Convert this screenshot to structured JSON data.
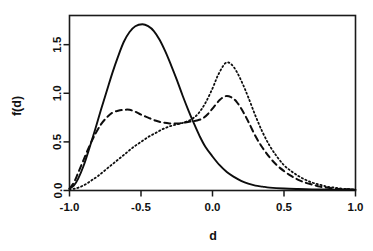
{
  "chart_data": {
    "type": "line",
    "title": "",
    "subtitle": "",
    "xlabel": "d",
    "ylabel": "f(d)",
    "xlim": [
      -1.0,
      1.0
    ],
    "ylim": [
      0.0,
      1.8
    ],
    "xticks": [
      -1.0,
      -0.5,
      0.0,
      0.5,
      1.0
    ],
    "xticklabels": [
      "-1.0",
      "-0.5",
      "0.0",
      "0.5",
      "1.0"
    ],
    "yticks": [
      0.0,
      0.5,
      1.0,
      1.5
    ],
    "yticklabels": [
      "0.0",
      "0.5",
      "1.0",
      "1.5"
    ],
    "grid": false,
    "legend": null,
    "legend_position": "none",
    "annotations": [],
    "series": [
      {
        "name": "solid",
        "linestyle": "solid",
        "color": "#0d0d0d",
        "x": [
          -1.0,
          -0.97,
          -0.94,
          -0.9,
          -0.86,
          -0.82,
          -0.78,
          -0.74,
          -0.7,
          -0.66,
          -0.62,
          -0.58,
          -0.54,
          -0.49,
          -0.45,
          -0.41,
          -0.37,
          -0.33,
          -0.29,
          -0.25,
          -0.21,
          -0.17,
          -0.13,
          -0.09,
          -0.05,
          0.0,
          0.05,
          0.1,
          0.15,
          0.2,
          0.25,
          0.3,
          0.35,
          0.4,
          0.5,
          0.6,
          0.7,
          0.8,
          0.9,
          1.0
        ],
        "y": [
          0.02,
          0.05,
          0.12,
          0.26,
          0.44,
          0.63,
          0.83,
          1.02,
          1.21,
          1.38,
          1.53,
          1.63,
          1.69,
          1.71,
          1.69,
          1.64,
          1.55,
          1.43,
          1.29,
          1.14,
          0.98,
          0.83,
          0.69,
          0.56,
          0.45,
          0.35,
          0.26,
          0.19,
          0.14,
          0.1,
          0.07,
          0.05,
          0.04,
          0.03,
          0.02,
          0.015,
          0.012,
          0.01,
          0.008,
          0.007
        ]
      },
      {
        "name": "dashed",
        "linestyle": "dashed",
        "color": "#0d0d0d",
        "x": [
          -1.0,
          -0.97,
          -0.94,
          -0.9,
          -0.86,
          -0.82,
          -0.78,
          -0.74,
          -0.7,
          -0.66,
          -0.62,
          -0.58,
          -0.54,
          -0.5,
          -0.45,
          -0.4,
          -0.35,
          -0.3,
          -0.26,
          -0.23,
          -0.19,
          -0.15,
          -0.11,
          -0.07,
          -0.03,
          0.01,
          0.05,
          0.09,
          0.13,
          0.17,
          0.21,
          0.25,
          0.3,
          0.35,
          0.4,
          0.45,
          0.5,
          0.55,
          0.6,
          0.65,
          0.7,
          0.75,
          0.8,
          0.85,
          0.9,
          0.95,
          1.0
        ],
        "y": [
          0.02,
          0.08,
          0.18,
          0.32,
          0.46,
          0.58,
          0.68,
          0.75,
          0.8,
          0.82,
          0.83,
          0.83,
          0.81,
          0.78,
          0.75,
          0.72,
          0.7,
          0.69,
          0.69,
          0.69,
          0.7,
          0.71,
          0.72,
          0.74,
          0.79,
          0.86,
          0.93,
          0.97,
          0.96,
          0.91,
          0.82,
          0.71,
          0.56,
          0.44,
          0.34,
          0.26,
          0.2,
          0.15,
          0.11,
          0.08,
          0.06,
          0.04,
          0.03,
          0.02,
          0.015,
          0.012,
          0.01
        ]
      },
      {
        "name": "dotted",
        "linestyle": "dotted",
        "color": "#0d0d0d",
        "x": [
          -1.0,
          -0.96,
          -0.92,
          -0.88,
          -0.84,
          -0.8,
          -0.75,
          -0.7,
          -0.65,
          -0.6,
          -0.55,
          -0.5,
          -0.45,
          -0.4,
          -0.35,
          -0.3,
          -0.25,
          -0.2,
          -0.15,
          -0.1,
          -0.05,
          0.0,
          0.04,
          0.09,
          0.13,
          0.17,
          0.21,
          0.25,
          0.3,
          0.35,
          0.4,
          0.45,
          0.5,
          0.55,
          0.6,
          0.65,
          0.7,
          0.75,
          0.8,
          0.85,
          0.9,
          0.95,
          1.0
        ],
        "y": [
          0.01,
          0.02,
          0.04,
          0.07,
          0.11,
          0.15,
          0.21,
          0.27,
          0.33,
          0.39,
          0.45,
          0.5,
          0.55,
          0.59,
          0.63,
          0.66,
          0.68,
          0.7,
          0.73,
          0.79,
          0.9,
          1.05,
          1.19,
          1.31,
          1.3,
          1.22,
          1.1,
          0.96,
          0.77,
          0.6,
          0.46,
          0.35,
          0.26,
          0.2,
          0.15,
          0.11,
          0.08,
          0.06,
          0.04,
          0.03,
          0.02,
          0.015,
          0.01
        ]
      }
    ]
  }
}
